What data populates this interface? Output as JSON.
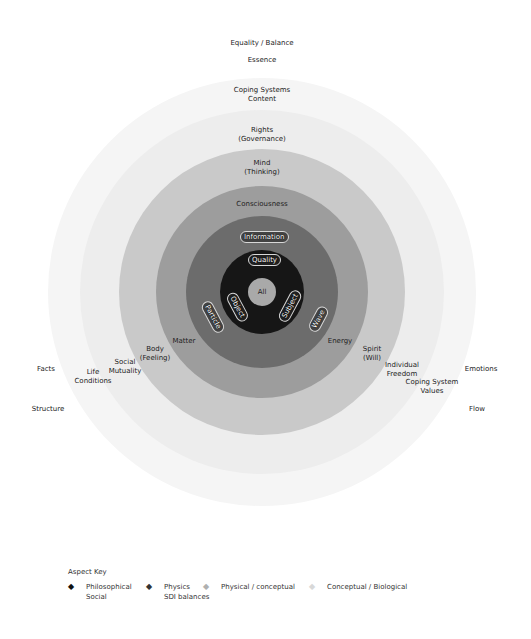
{
  "diagram": {
    "type": "concentric-circles",
    "center": {
      "x": 262,
      "y": 292
    },
    "rings": [
      {
        "name": "outer-faint",
        "radius": 214,
        "color": "#f5f5f5"
      },
      {
        "name": "second-faint",
        "radius": 182,
        "color": "#ededed"
      },
      {
        "name": "light",
        "radius": 143,
        "color": "#c9c9c9"
      },
      {
        "name": "medium",
        "radius": 106,
        "color": "#9d9d9d"
      },
      {
        "name": "dark",
        "radius": 76,
        "color": "#6c6c6c"
      },
      {
        "name": "black",
        "radius": 42,
        "color": "#161616"
      },
      {
        "name": "core",
        "radius": 14,
        "color": "#a9a9a9"
      }
    ],
    "center_label": "All",
    "top_labels": {
      "equality": "Equality / Balance",
      "essence": "Essence",
      "coping_content_1": "Coping Systems",
      "coping_content_2": "Content",
      "rights_1": "Rights",
      "rights_2": "(Governance)",
      "mind_1": "Mind",
      "mind_2": "(Thinking)",
      "consciousness": "Consciousness"
    },
    "pill_labels": {
      "information": "Information",
      "quality": "Quality",
      "object": "Object",
      "particle": "Particle",
      "subject": "Subject",
      "wave": "Wave"
    },
    "left_labels": {
      "matter": "Matter",
      "body_1": "Body",
      "body_2": "(Feeling)",
      "social_1": "Social",
      "social_2": "Mutuality",
      "life_1": "Life",
      "life_2": "Conditions",
      "facts": "Facts",
      "structure": "Structure"
    },
    "right_labels": {
      "energy": "Energy",
      "spirit_1": "Spirit",
      "spirit_2": "(Will)",
      "individual_1": "Individual",
      "individual_2": "Freedom",
      "coping_values_1": "Coping System",
      "coping_values_2": "Values",
      "emotions": "Emotions",
      "flow": "Flow"
    }
  },
  "legend": {
    "title": "Aspect Key",
    "items": [
      {
        "line1": "Philosophical",
        "line2": "Social",
        "bullet": "◆",
        "color": "#111111"
      },
      {
        "line1": "Physics",
        "line2": "SDI balances",
        "bullet": "◆",
        "color": "#333333"
      },
      {
        "line1": "Physical / conceptual",
        "line2": "",
        "bullet": "◆",
        "color": "#b0b0b0"
      },
      {
        "line1": "Conceptual / Biological",
        "line2": "",
        "bullet": "◆",
        "color": "#d8d8d8"
      }
    ]
  }
}
